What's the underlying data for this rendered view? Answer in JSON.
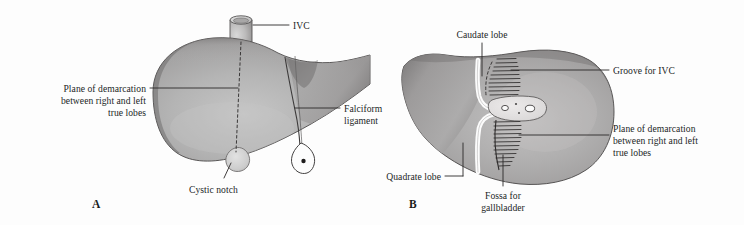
{
  "figure": {
    "background_color": "#fdfdfd",
    "ink_color": "#221f1f",
    "organ_fill_mid": "#adadad",
    "organ_fill_dark": "#6f6d6d",
    "organ_fill_light": "#d8d8d8",
    "organ_outline": "#4a4747"
  },
  "panels": [
    {
      "letter": "A",
      "view": "anterior",
      "labels": [
        {
          "id": "ivc",
          "text": "IVC",
          "lines": [
            "IVC"
          ],
          "align": "left"
        },
        {
          "id": "plane-of-demarcation-a",
          "text": "Plane of demarcation between right and left true lobes",
          "lines": [
            "Plane of demarcation",
            "between right and left",
            "true lobes"
          ],
          "align": "right"
        },
        {
          "id": "falciform-ligament",
          "text": "Falciform ligament",
          "lines": [
            "Falciform",
            "ligament"
          ],
          "align": "left"
        },
        {
          "id": "cystic-notch",
          "text": "Cystic notch",
          "lines": [
            "Cystic notch"
          ],
          "align": "center"
        }
      ]
    },
    {
      "letter": "B",
      "view": "posteroinferior",
      "labels": [
        {
          "id": "caudate-lobe",
          "text": "Caudate lobe",
          "lines": [
            "Caudate lobe"
          ],
          "align": "center"
        },
        {
          "id": "groove-for-ivc",
          "text": "Groove for IVC",
          "lines": [
            "Groove for IVC"
          ],
          "align": "left"
        },
        {
          "id": "plane-of-demarcation-b",
          "text": "Plane of demarcation between right and left true lobes",
          "lines": [
            "Plane of demarcation",
            "between right and left",
            "true lobes"
          ],
          "align": "left"
        },
        {
          "id": "quadrate-lobe",
          "text": "Quadrate lobe",
          "lines": [
            "Quadrate lobe"
          ],
          "align": "right"
        },
        {
          "id": "fossa-for-gallbladder",
          "text": "Fossa for gallbladder",
          "lines": [
            "Fossa for",
            "gallbladder"
          ],
          "align": "center"
        }
      ]
    }
  ],
  "text": {
    "panel_a_letter": "A",
    "panel_b_letter": "B",
    "ivc": "IVC",
    "plane_a_l1": "Plane of demarcation",
    "plane_a_l2": "between right and left",
    "plane_a_l3": "true lobes",
    "falciform_l1": "Falciform",
    "falciform_l2": "ligament",
    "cystic_notch": "Cystic notch",
    "caudate_lobe": "Caudate lobe",
    "groove_for_ivc": "Groove for IVC",
    "plane_b_l1": "Plane of demarcation",
    "plane_b_l2": "between right and left",
    "plane_b_l3": "true lobes",
    "quadrate_lobe": "Quadrate lobe",
    "fossa_l1": "Fossa for",
    "fossa_l2": "gallbladder"
  }
}
